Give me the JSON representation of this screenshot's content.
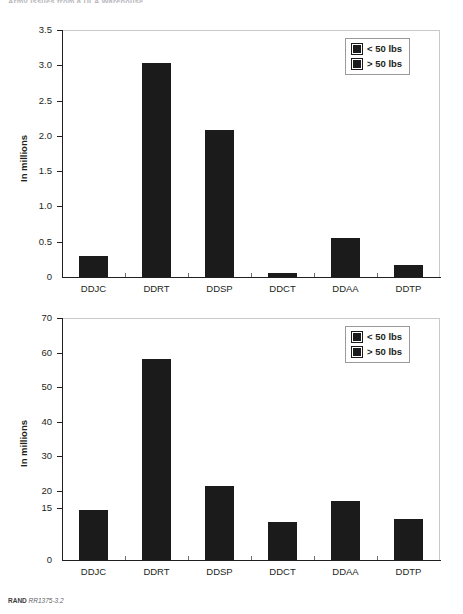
{
  "page": {
    "running_header": "Army Issues from a DLA Warehouse",
    "footer_source": "RAND",
    "footer_figure_id": "RR1375-3.2"
  },
  "legend": {
    "items": [
      {
        "label": "< 50 lbs",
        "color": "#1b1b1b"
      },
      {
        "label": "> 50 lbs",
        "color": "#1b1b1b"
      }
    ]
  },
  "chart_data": [
    {
      "id": "top",
      "type": "bar",
      "title": "",
      "xlabel": "",
      "ylabel": "In millions",
      "categories": [
        "DDJC",
        "DDRT",
        "DDSP",
        "DDCT",
        "DDAA",
        "DDTP"
      ],
      "values": [
        0.3,
        3.03,
        2.09,
        0.05,
        0.55,
        0.17
      ],
      "series": [
        {
          "name": "< 50 lbs",
          "values": [
            0.3,
            3.03,
            2.09,
            0.05,
            0.55,
            0.17
          ]
        }
      ],
      "yticks": [
        "0",
        "0.5",
        "1.0",
        "1.5",
        "2.0",
        "2.5",
        "3.0",
        "3.5"
      ],
      "ytick_values": [
        0,
        0.5,
        1.0,
        1.5,
        2.0,
        2.5,
        3.0,
        3.5
      ],
      "ylim": [
        0,
        3.5
      ],
      "grid": false,
      "legend_position": "top-right"
    },
    {
      "id": "bottom",
      "type": "bar",
      "title": "",
      "xlabel": "",
      "ylabel": "In millions",
      "categories": [
        "DDJC",
        "DDRT",
        "DDSP",
        "DDCT",
        "DDAA",
        "DDTP"
      ],
      "values": [
        14.5,
        58.0,
        21.5,
        11.0,
        17.2,
        12.0
      ],
      "series": [
        {
          "name": "> 50 lbs",
          "values": [
            14.5,
            58.0,
            21.5,
            11.0,
            17.2,
            12.0
          ]
        }
      ],
      "yticks": [
        "0",
        "15",
        "20",
        "30",
        "40",
        "50",
        "60",
        "70"
      ],
      "ytick_values": [
        0,
        15,
        20,
        30,
        40,
        50,
        60,
        70
      ],
      "ylim": [
        0,
        70
      ],
      "grid": false,
      "legend_position": "top-right"
    }
  ]
}
